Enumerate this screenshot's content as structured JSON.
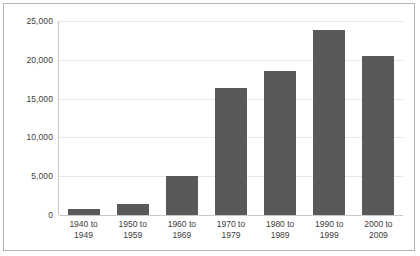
{
  "chart_data": {
    "type": "bar",
    "title": "",
    "xlabel": "",
    "ylabel": "",
    "categories": [
      "1940 to 1949",
      "1950 to 1959",
      "1960 to 1969",
      "1970 to 1979",
      "1980 to 1989",
      "1990 to 1999",
      "2000 to 2009"
    ],
    "category_lines": [
      {
        "line1": "1940 to",
        "line2": "1949"
      },
      {
        "line1": "1950 to",
        "line2": "1959"
      },
      {
        "line1": "1960 to",
        "line2": "1969"
      },
      {
        "line1": "1970 to",
        "line2": "1979"
      },
      {
        "line1": "1980 to",
        "line2": "1989"
      },
      {
        "line1": "1990 to",
        "line2": "1999"
      },
      {
        "line1": "2000 to",
        "line2": "2009"
      }
    ],
    "values": [
      800,
      1400,
      5000,
      16400,
      18500,
      23900,
      20500
    ],
    "ylim": [
      0,
      25000
    ],
    "yticks": [
      0,
      5000,
      10000,
      15000,
      20000,
      25000
    ],
    "ytick_labels": [
      "0",
      "5,000",
      "10,000",
      "15,000",
      "20,000",
      "25,000"
    ],
    "grid": true,
    "legend": "none",
    "bar_color": "#595959",
    "gridline_color": "#e6e6e6",
    "axis_color": "#c9c9c9",
    "border_color": "#b5b5b5",
    "background_color": "#ffffff",
    "text_color": "#3d3d3d"
  }
}
